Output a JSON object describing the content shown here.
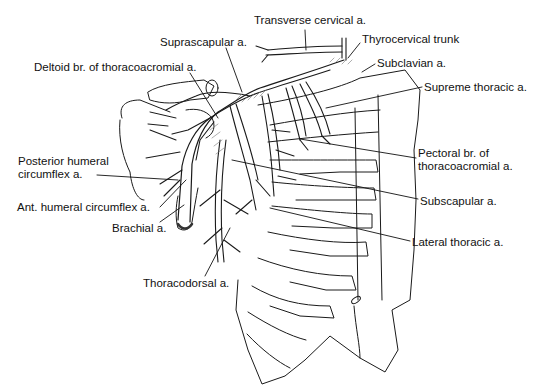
{
  "figure": {
    "labels": [
      {
        "id": "transverse-cervical",
        "lines": [
          "Transverse cervical a."
        ],
        "x": 312,
        "y": 14
      },
      {
        "id": "suprascapular",
        "lines": [
          "Suprascapular a."
        ],
        "x": 160,
        "y": 36
      },
      {
        "id": "thyrocervical-trunk",
        "lines": [
          "Thyrocervical trunk"
        ],
        "x": 362,
        "y": 33
      },
      {
        "id": "deltoid-branch",
        "lines": [
          "Deltoid br. of thoracoacromial a."
        ],
        "x": 34,
        "y": 61
      },
      {
        "id": "subclavian",
        "lines": [
          "Subclavian a."
        ],
        "x": 377,
        "y": 57
      },
      {
        "id": "supreme-thoracic",
        "lines": [
          "Supreme thoracic a."
        ],
        "x": 424,
        "y": 81
      },
      {
        "id": "posterior-humeral-circumflex",
        "lines": [
          "Posterior humeral",
          "circumflex a."
        ],
        "x": 18,
        "y": 155
      },
      {
        "id": "pectoral-branch",
        "lines": [
          "Pectoral br. of",
          "thoracoacromial a."
        ],
        "x": 418,
        "y": 147
      },
      {
        "id": "ant-humeral-circumflex",
        "lines": [
          "Ant. humeral circumflex a."
        ],
        "x": 17,
        "y": 201
      },
      {
        "id": "subscapular",
        "lines": [
          "Subscapular a."
        ],
        "x": 420,
        "y": 195
      },
      {
        "id": "brachial",
        "lines": [
          "Brachial a."
        ],
        "x": 112,
        "y": 222
      },
      {
        "id": "lateral-thoracic",
        "lines": [
          "Lateral thoracic a."
        ],
        "x": 412,
        "y": 236
      },
      {
        "id": "thoracodorsal",
        "lines": [
          "Thoracodorsal a."
        ],
        "x": 143,
        "y": 277
      }
    ],
    "leader_lines": [
      {
        "id": "transverse-cervical",
        "x1": 305,
        "y1": 30,
        "x2": 306,
        "y2": 50
      },
      {
        "id": "suprascapular",
        "x1": 226,
        "y1": 48,
        "x2": 242,
        "y2": 92
      },
      {
        "id": "thyrocervical-trunk",
        "x1": 360,
        "y1": 43,
        "x2": 348,
        "y2": 58
      },
      {
        "id": "deltoid-branch",
        "x1": 190,
        "y1": 73,
        "x2": 218,
        "y2": 118
      },
      {
        "id": "subclavian",
        "x1": 375,
        "y1": 64,
        "x2": 362,
        "y2": 72
      },
      {
        "id": "supreme-thoracic",
        "x1": 422,
        "y1": 87,
        "x2": 326,
        "y2": 108
      },
      {
        "id": "posterior-humeral-circumflex",
        "x1": 97,
        "y1": 175,
        "x2": 178,
        "y2": 180
      },
      {
        "id": "pectoral-branch",
        "x1": 416,
        "y1": 158,
        "x2": 300,
        "y2": 139
      },
      {
        "id": "ant-humeral-circumflex",
        "x1": 160,
        "y1": 207,
        "x2": 186,
        "y2": 180
      },
      {
        "id": "subscapular",
        "x1": 418,
        "y1": 199,
        "x2": 232,
        "y2": 160
      },
      {
        "id": "brachial",
        "x1": 160,
        "y1": 222,
        "x2": 184,
        "y2": 205
      },
      {
        "id": "lateral-thoracic",
        "x1": 410,
        "y1": 241,
        "x2": 270,
        "y2": 208
      },
      {
        "id": "thoracodorsal",
        "x1": 205,
        "y1": 276,
        "x2": 230,
        "y2": 228
      }
    ]
  }
}
